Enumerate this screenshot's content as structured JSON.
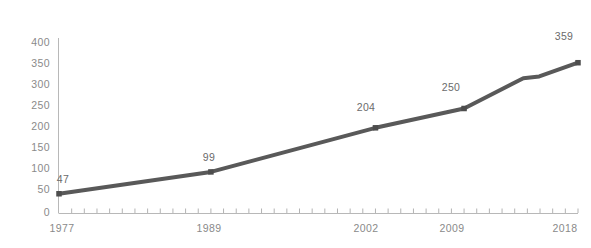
{
  "chart_data": {
    "type": "line",
    "title": "",
    "subtitle": "",
    "xlabel": "",
    "ylabel": "",
    "x": [
      1977,
      1989,
      2002,
      2009,
      2018
    ],
    "values": [
      47,
      99,
      204,
      250,
      359
    ],
    "point_labels": [
      "47",
      "99",
      "204",
      "250",
      "359"
    ],
    "series": [
      {
        "name": "",
        "x": [
          1977,
          1989,
          2002,
          2009,
          2018
        ],
        "values": [
          47,
          99,
          204,
          250,
          359
        ]
      }
    ],
    "ylim": [
      0,
      400
    ],
    "xlim": [
      1977,
      2018
    ],
    "y_ticks": [
      0,
      50,
      100,
      150,
      200,
      250,
      300,
      350,
      400
    ],
    "y_tick_labels": [
      "0",
      "50",
      "100",
      "150",
      "200",
      "250",
      "300",
      "350",
      "400"
    ],
    "x_tick_labels": [
      "1977",
      "1989",
      "2002",
      "2009",
      "2018"
    ],
    "x_minor_tick_count": 41,
    "grid": false,
    "legend": null,
    "legend_position": "none",
    "marker": "square",
    "colors": {
      "line": "#595959",
      "marker": "#4d4d4d",
      "axis": "#b3b3b3",
      "tick_label": "#8a8a8a",
      "value_label": "#6b6b6b",
      "background": "#ffffff"
    }
  }
}
